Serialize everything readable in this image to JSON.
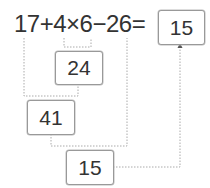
{
  "expression": "17+4×6−26=",
  "answer": "15",
  "steps": [
    {
      "operation": "4×6",
      "result": "24"
    },
    {
      "operation": "17+24",
      "result": "41"
    },
    {
      "operation": "41−26",
      "result": "15"
    }
  ],
  "colors": {
    "line": "#aaaaaa",
    "box_border": "#999999",
    "text": "#333333"
  }
}
